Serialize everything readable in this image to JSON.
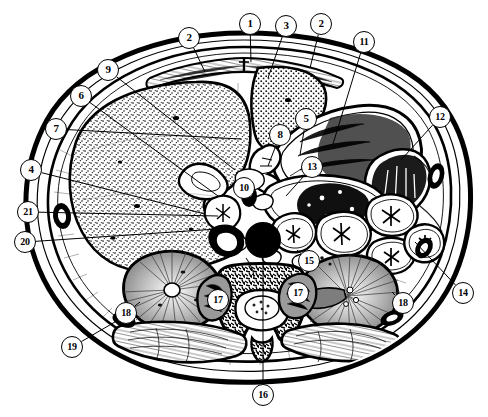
{
  "figure": {
    "kind": "labeled-anatomy-diagram",
    "width": 488,
    "height": 417,
    "background_color": "#ffffff",
    "ink_color": "#000000",
    "orientation": "transverse (axial) section, anterior at top, posterior at bottom",
    "label_count": 21
  },
  "callouts": [
    {
      "id": "c1",
      "label": "2",
      "cx": 189,
      "cy": 38,
      "leader_to": [
        205,
        72
      ]
    },
    {
      "id": "c2",
      "label": "1",
      "cx": 250,
      "cy": 24,
      "leader_to": [
        251,
        62
      ]
    },
    {
      "id": "c3",
      "label": "3",
      "cx": 286,
      "cy": 26,
      "leader_to": [
        268,
        78
      ]
    },
    {
      "id": "c4",
      "label": "2",
      "cx": 321,
      "cy": 24,
      "leader_to": [
        310,
        68
      ]
    },
    {
      "id": "c5",
      "label": "11",
      "cx": 364,
      "cy": 42,
      "leader_to": [
        333,
        144
      ]
    },
    {
      "id": "c6",
      "label": "9",
      "cx": 108,
      "cy": 70,
      "leader_to": [
        235,
        170
      ]
    },
    {
      "id": "c7",
      "label": "6",
      "cx": 81,
      "cy": 96,
      "leader_to": [
        218,
        196
      ]
    },
    {
      "id": "c8",
      "label": "7",
      "cx": 56,
      "cy": 129,
      "leader_to": [
        241,
        139
      ]
    },
    {
      "id": "c9",
      "label": "12",
      "cx": 440,
      "cy": 117,
      "leader_to": [
        401,
        160
      ]
    },
    {
      "id": "c10",
      "label": "8",
      "cx": 280,
      "cy": 135,
      "leader_to": [
        268,
        166
      ]
    },
    {
      "id": "c11",
      "label": "5",
      "cx": 306,
      "cy": 119,
      "leader_to": [
        300,
        155
      ]
    },
    {
      "id": "c12",
      "label": "13",
      "cx": 312,
      "cy": 167,
      "leader_to": [
        286,
        196
      ]
    },
    {
      "id": "c13",
      "label": "4",
      "cx": 31,
      "cy": 170,
      "leader_to": [
        205,
        214
      ]
    },
    {
      "id": "c14",
      "label": "10",
      "cx": 244,
      "cy": 188,
      "leader_to": [
        252,
        200
      ]
    },
    {
      "id": "c15",
      "label": "21",
      "cx": 28,
      "cy": 212,
      "leader_to": [
        218,
        216
      ]
    },
    {
      "id": "c16",
      "label": "20",
      "cx": 25,
      "cy": 242,
      "leader_to": [
        232,
        228
      ]
    },
    {
      "id": "c17",
      "label": "15",
      "cx": 309,
      "cy": 261,
      "leader_to": [
        297,
        250
      ]
    },
    {
      "id": "c18",
      "label": "14",
      "cx": 463,
      "cy": 293,
      "leader_to": [
        415,
        242
      ]
    },
    {
      "id": "c19",
      "label": "17",
      "cx": 218,
      "cy": 300,
      "leader_to": [
        225,
        292
      ]
    },
    {
      "id": "c20",
      "label": "17",
      "cx": 298,
      "cy": 293,
      "leader_to": [
        292,
        286
      ]
    },
    {
      "id": "c21",
      "label": "18",
      "cx": 126,
      "cy": 313,
      "leader_to": [
        140,
        302
      ]
    },
    {
      "id": "c22",
      "label": "18",
      "cx": 403,
      "cy": 303,
      "leader_to": [
        392,
        292
      ]
    },
    {
      "id": "c23",
      "label": "19",
      "cx": 72,
      "cy": 347,
      "leader_to": [
        132,
        312
      ]
    },
    {
      "id": "c24",
      "label": "16",
      "cx": 263,
      "cy": 395,
      "leader_to": [
        263,
        240
      ]
    }
  ],
  "legend_note": "Leader lines run from each numbered circle to the structure it marks."
}
